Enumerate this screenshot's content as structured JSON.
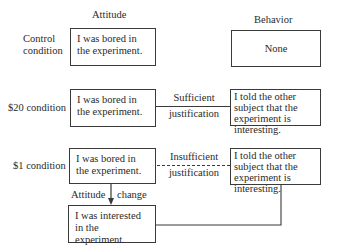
{
  "headers": {
    "attitude": "Attitude",
    "behavior": "Behavior"
  },
  "rows": [
    {
      "condition": "Control condition",
      "condition_lines": [
        "Control",
        "condition"
      ],
      "attitude": "I was bored in the experiment.",
      "behavior": "None",
      "justification": "",
      "connector": "none"
    },
    {
      "condition": "$20 condition",
      "condition_lines": [
        "$20 condition"
      ],
      "attitude": "I was bored in the experiment.",
      "behavior": "I told the other subject that the experiment is interesting.",
      "justification": "Sufficient justification",
      "justification_lines": [
        "Sufficient",
        "justification"
      ],
      "connector": "solid"
    },
    {
      "condition": "$1 condition",
      "condition_lines": [
        "$1 condition"
      ],
      "attitude": "I was bored in the experiment.",
      "behavior": "I told the other subject that the experiment is interesting.",
      "justification": "Insufficient justification",
      "justification_lines": [
        "Insufficient",
        "justification"
      ],
      "connector": "dashed"
    }
  ],
  "attitude_change": {
    "label_left": "Attitude",
    "label_right": "change",
    "result": "I was interested in the experiment."
  }
}
